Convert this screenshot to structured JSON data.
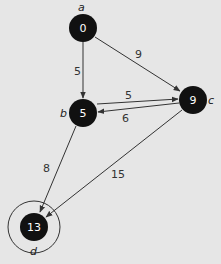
{
  "colors": {
    "background": "#e6e6e6",
    "node_fill": "#111111",
    "edge": "#333333",
    "node_text": "#ffffff"
  },
  "nodes": [
    {
      "id": "a",
      "letter": "a",
      "value": "0"
    },
    {
      "id": "b",
      "letter": "b",
      "value": "5"
    },
    {
      "id": "c",
      "letter": "c",
      "value": "9"
    },
    {
      "id": "d",
      "letter": "d",
      "value": "13",
      "highlighted": true
    }
  ],
  "edges": [
    {
      "from": "a",
      "to": "b",
      "weight": "5"
    },
    {
      "from": "a",
      "to": "c",
      "weight": "9"
    },
    {
      "from": "b",
      "to": "c",
      "weight": "5"
    },
    {
      "from": "c",
      "to": "b",
      "weight": "6"
    },
    {
      "from": "b",
      "to": "d",
      "weight": "8"
    },
    {
      "from": "c",
      "to": "d",
      "weight": "15"
    }
  ]
}
